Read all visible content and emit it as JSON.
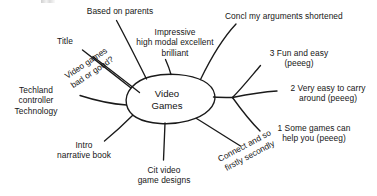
{
  "diagram": {
    "type": "mind-map",
    "style": "hand-drawn black ink on white paper",
    "center": {
      "id": "center-node",
      "label": "Video\nGames",
      "shape": "ellipse"
    },
    "branches": [
      {
        "id": "title",
        "label": "Title",
        "position": "upper-left",
        "orientation": "horizontal"
      },
      {
        "id": "video-games-bad-or-good",
        "label": "Video games\nbad or good?",
        "position": "upper-left-diagonal",
        "orientation": "rotated",
        "rotation_deg": -34
      },
      {
        "id": "based-on-parents",
        "label": "Based on parents",
        "position": "top-left",
        "orientation": "horizontal"
      },
      {
        "id": "impressive-high-modal",
        "label": "Impressive\nhigh modal excellent\nbrilliant",
        "position": "top-center",
        "orientation": "horizontal"
      },
      {
        "id": "concl-my-arguments-shortened",
        "label": "Concl my arguments shortened",
        "position": "top-right",
        "orientation": "horizontal"
      },
      {
        "id": "fun-and-easy",
        "label": "3 Fun and easy\n(peeeg)",
        "position": "right-upper",
        "orientation": "horizontal"
      },
      {
        "id": "very-easy-to-carry-around",
        "label": "2 Very easy to carry\naround (peeeg)",
        "position": "right-middle",
        "orientation": "horizontal"
      },
      {
        "id": "some-games-can-help-you",
        "label": "1 Some games can\nhelp you (peeeg)",
        "position": "right-lower",
        "orientation": "horizontal"
      },
      {
        "id": "connect-and-so-firstly-secondly",
        "label": "Connect and so\nfirstly secondly",
        "position": "bottom-right-diagonal",
        "orientation": "rotated",
        "rotation_deg": -28
      },
      {
        "id": "cit-video-game-designs",
        "label": "Cit video\ngame designs",
        "position": "bottom-center",
        "orientation": "horizontal"
      },
      {
        "id": "intro-narrative-book",
        "label": "Intro\nnarrative book",
        "position": "bottom-left",
        "orientation": "horizontal"
      },
      {
        "id": "techland-controller-technology",
        "label": "Techland\ncontroller\nTechnology",
        "position": "left",
        "orientation": "horizontal"
      }
    ],
    "colors": {
      "ink": "#161616",
      "paper": "#ffffff"
    }
  }
}
